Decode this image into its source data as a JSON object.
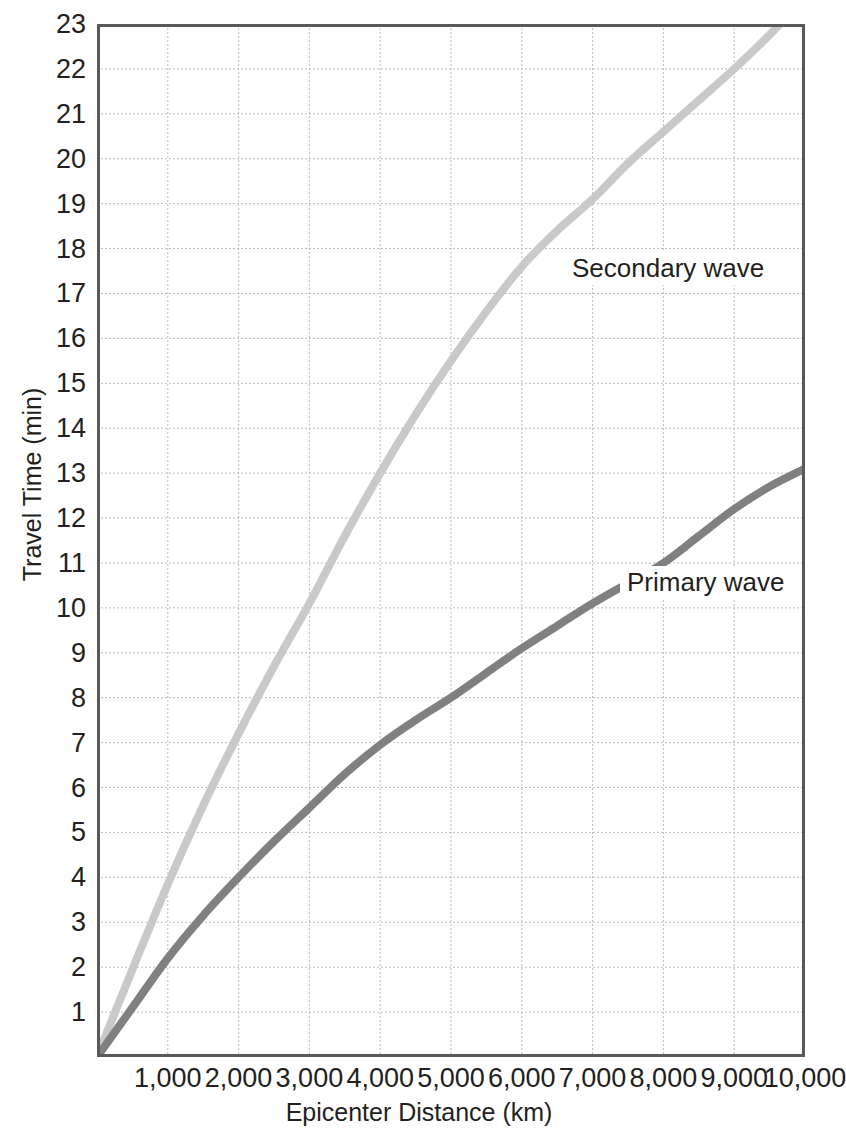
{
  "chart_data": {
    "type": "line",
    "title": "",
    "xlabel": "Epicenter Distance (km)",
    "ylabel": "Travel Time (min)",
    "xlim": [
      0,
      10000
    ],
    "ylim": [
      0,
      23
    ],
    "grid": true,
    "legend_position": "inline-annotation",
    "x_ticks": [
      {
        "value": 1000,
        "label": "1,000"
      },
      {
        "value": 2000,
        "label": "2,000"
      },
      {
        "value": 3000,
        "label": "3,000"
      },
      {
        "value": 4000,
        "label": "4,000"
      },
      {
        "value": 5000,
        "label": "5,000"
      },
      {
        "value": 6000,
        "label": "6,000"
      },
      {
        "value": 7000,
        "label": "7,000"
      },
      {
        "value": 8000,
        "label": "8,000"
      },
      {
        "value": 9000,
        "label": "9,000"
      },
      {
        "value": 10000,
        "label": "10,000"
      }
    ],
    "y_ticks": [
      {
        "value": 1,
        "label": "1"
      },
      {
        "value": 2,
        "label": "2"
      },
      {
        "value": 3,
        "label": "3"
      },
      {
        "value": 4,
        "label": "4"
      },
      {
        "value": 5,
        "label": "5"
      },
      {
        "value": 6,
        "label": "6"
      },
      {
        "value": 7,
        "label": "7"
      },
      {
        "value": 8,
        "label": "8"
      },
      {
        "value": 9,
        "label": "9"
      },
      {
        "value": 10,
        "label": "10"
      },
      {
        "value": 11,
        "label": "11"
      },
      {
        "value": 12,
        "label": "12"
      },
      {
        "value": 13,
        "label": "13"
      },
      {
        "value": 14,
        "label": "14"
      },
      {
        "value": 15,
        "label": "15"
      },
      {
        "value": 16,
        "label": "16"
      },
      {
        "value": 17,
        "label": "17"
      },
      {
        "value": 18,
        "label": "18"
      },
      {
        "value": 19,
        "label": "19"
      },
      {
        "value": 20,
        "label": "20"
      },
      {
        "value": 21,
        "label": "21"
      },
      {
        "value": 22,
        "label": "22"
      },
      {
        "value": 23,
        "label": "23"
      }
    ],
    "series": [
      {
        "name": "Secondary wave",
        "color": "#c9c9c9",
        "annotation": "Secondary wave",
        "x": [
          0,
          500,
          1000,
          1500,
          2000,
          2500,
          3000,
          3500,
          4000,
          4500,
          5000,
          5500,
          6000,
          6500,
          7000,
          7500,
          8000,
          8500,
          9000,
          9400,
          9650
        ],
        "y": [
          0,
          1.95,
          3.85,
          5.6,
          7.2,
          8.7,
          10.1,
          11.6,
          13.0,
          14.3,
          15.5,
          16.6,
          17.6,
          18.4,
          19.1,
          19.9,
          20.6,
          21.3,
          22.0,
          22.6,
          23.0
        ]
      },
      {
        "name": "Primary wave",
        "color": "#808080",
        "annotation": "Primary wave",
        "x": [
          0,
          500,
          1000,
          1500,
          2000,
          2500,
          3000,
          3500,
          4000,
          4500,
          5000,
          5500,
          6000,
          6500,
          7000,
          7500,
          8000,
          8500,
          9000,
          9500,
          10000
        ],
        "y": [
          0,
          1.1,
          2.2,
          3.15,
          4.0,
          4.8,
          5.55,
          6.3,
          6.95,
          7.5,
          8.0,
          8.55,
          9.1,
          9.6,
          10.1,
          10.55,
          11.0,
          11.6,
          12.2,
          12.7,
          13.1
        ]
      }
    ]
  }
}
